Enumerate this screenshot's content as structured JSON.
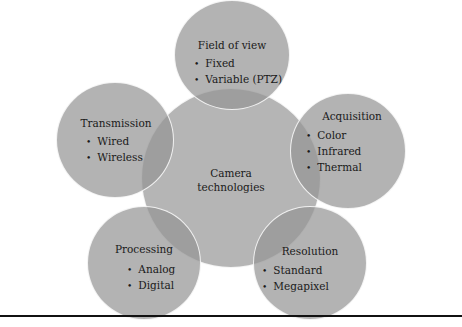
{
  "diagram": {
    "center": {
      "line1": "Camera",
      "line2": "technologies"
    },
    "nodes": [
      {
        "title": "Field of view",
        "items": [
          "Fixed",
          "Variable (PTZ)"
        ]
      },
      {
        "title": "Acquisition",
        "items": [
          "Color",
          "Infrared",
          "Thermal"
        ]
      },
      {
        "title": "Resolution",
        "items": [
          "Standard",
          "Megapixel"
        ]
      },
      {
        "title": "Processing",
        "items": [
          "Analog",
          "Digital"
        ]
      },
      {
        "title": "Transmission",
        "items": [
          "Wired",
          "Wireless"
        ]
      }
    ],
    "colors": {
      "circle_fill": "#969696",
      "rule": "#111111"
    }
  }
}
